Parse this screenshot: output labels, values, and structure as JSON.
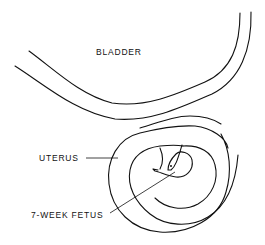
{
  "diagram": {
    "type": "anatomical line drawing",
    "labels": {
      "bladder": "BLADDER",
      "uterus": "UTERUS",
      "fetus": "7-WEEK FETUS"
    },
    "colors": {
      "ink": "#111111",
      "background": "#ffffff"
    }
  }
}
